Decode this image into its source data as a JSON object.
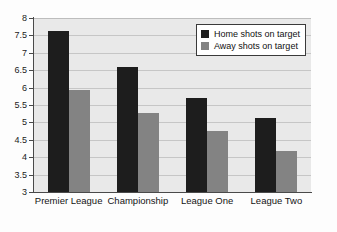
{
  "chart_data": {
    "type": "bar",
    "title": "",
    "subtitle": "",
    "xlabel": "",
    "ylabel": "",
    "categories": [
      "Premier League",
      "Championship",
      "League One",
      "League Two"
    ],
    "series": [
      {
        "name": "Home shots on target",
        "color": "#1d1d1d",
        "values": [
          7.62,
          6.6,
          5.7,
          5.12
        ]
      },
      {
        "name": "Away shots on target",
        "color": "#838383",
        "values": [
          5.93,
          5.27,
          4.75,
          4.18
        ]
      }
    ],
    "ylim": [
      3,
      8
    ],
    "ytick_step": 0.5,
    "ytick_labels": [
      "8",
      "7.5",
      "7",
      "6.5",
      "6",
      "5.5",
      "5",
      "4.5",
      "4",
      "3.5",
      "3"
    ],
    "grid": true,
    "grid_axis": "y",
    "legend_position": "top-right",
    "plot_background": "#e9e9e9",
    "figure_background": "#fdfdfd",
    "axis_color": "#4a4a4a",
    "gridline_color": "#c6c6c6"
  }
}
